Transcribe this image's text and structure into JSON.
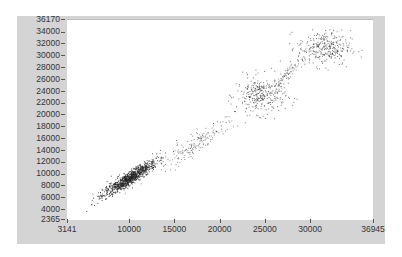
{
  "chart_data": {
    "type": "scatter",
    "title": "",
    "xlabel": "",
    "ylabel": "",
    "xlim": [
      3141,
      36945
    ],
    "ylim": [
      2365,
      36170
    ],
    "grid": false,
    "legend": null,
    "x_ticks": [
      "3141",
      "10000",
      "15000",
      "20000",
      "25000",
      "30000",
      "36945"
    ],
    "y_ticks": [
      "36170",
      "34000",
      "32000",
      "30000",
      "28000",
      "26000",
      "24000",
      "22000",
      "20000",
      "18000",
      "16000",
      "14000",
      "12000",
      "10000",
      "8000",
      "6000",
      "4000",
      "2365"
    ],
    "clusters": [
      {
        "name": "dense-low",
        "x_range": [
          7000,
          13500
        ],
        "y_range": [
          5800,
          12500
        ],
        "center": [
          10000,
          9500
        ],
        "approx_points": 900,
        "density": "high"
      },
      {
        "name": "trail",
        "x_range": [
          13000,
          22500
        ],
        "y_range": [
          10500,
          20500
        ],
        "center": [
          17500,
          15500
        ],
        "approx_points": 180,
        "density": "low"
      },
      {
        "name": "mid-cluster",
        "x_range": [
          21500,
          27500
        ],
        "y_range": [
          19500,
          26500
        ],
        "center": [
          24500,
          23500
        ],
        "approx_points": 300,
        "density": "medium"
      },
      {
        "name": "upper-trail",
        "x_range": [
          26000,
          29500
        ],
        "y_range": [
          22500,
          29000
        ],
        "center": [
          27500,
          27000
        ],
        "approx_points": 80,
        "density": "low"
      },
      {
        "name": "top-cluster",
        "x_range": [
          28000,
          34500
        ],
        "y_range": [
          28000,
          34500
        ],
        "center": [
          31500,
          31500
        ],
        "approx_points": 300,
        "density": "medium"
      }
    ],
    "point_color": "#222222",
    "trend": "strong positive linear correlation (y ≈ x)"
  },
  "axes": {
    "y_labels": [
      "36170",
      "34000",
      "32000",
      "30000",
      "28000",
      "26000",
      "24000",
      "22000",
      "20000",
      "18000",
      "16000",
      "14000",
      "12000",
      "10000",
      "8000",
      "6000",
      "4000",
      "2365"
    ],
    "x_labels": [
      "3141",
      "10000",
      "15000",
      "20000",
      "25000",
      "30000",
      "36945"
    ]
  },
  "colors": {
    "frame": "#d4d4d4",
    "plot_bg": "#ffffff",
    "points": "#222222"
  }
}
